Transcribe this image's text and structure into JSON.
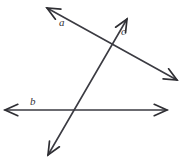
{
  "figure": {
    "type": "line-diagram",
    "width": 182,
    "height": 160,
    "background_color": "#ffffff",
    "stroke_color": "#3b3b42",
    "label_color": "#333338"
  },
  "labels": {
    "a": "a",
    "b": "b",
    "c": "c"
  },
  "lines": [
    {
      "name": "line-a",
      "label": "a",
      "description": "double-headed line sloping down to the right",
      "start": {
        "x": 47,
        "y": 8
      },
      "end": {
        "x": 177,
        "y": 80
      },
      "arrow_start": true,
      "arrow_end": true
    },
    {
      "name": "line-b",
      "label": "b",
      "description": "horizontal double-headed line",
      "start": {
        "x": 5,
        "y": 110
      },
      "end": {
        "x": 167,
        "y": 110
      },
      "arrow_start": true,
      "arrow_end": true
    },
    {
      "name": "line-c",
      "label": "c",
      "description": "double-headed line sloping up to the right, transversal",
      "start": {
        "x": 48,
        "y": 155
      },
      "end": {
        "x": 127,
        "y": 19
      },
      "arrow_start": true,
      "arrow_end": true
    }
  ],
  "intersections": [
    {
      "name": "intersection-a-c",
      "lines": [
        "a",
        "c"
      ],
      "x": 113,
      "y": 45
    },
    {
      "name": "intersection-b-c",
      "lines": [
        "b",
        "c"
      ],
      "x": 75,
      "y": 110
    }
  ]
}
